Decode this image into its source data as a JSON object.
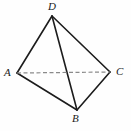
{
  "figure": {
    "kind": "tetrahedron-diagram",
    "background_color": "#fefefe",
    "stroke_color": "#1c1c1c",
    "hidden_stroke_color": "#8a8a8a",
    "solid_stroke_width": 1.6,
    "hidden_stroke_width": 1.2,
    "hidden_dash_pattern": "4,2.5",
    "vertices": [
      {
        "id": "D",
        "label": "D",
        "x": 52,
        "y": 16
      },
      {
        "id": "A",
        "label": "A",
        "x": 17,
        "y": 73
      },
      {
        "id": "C",
        "label": "C",
        "x": 110,
        "y": 72
      },
      {
        "id": "B",
        "label": "B",
        "x": 77,
        "y": 110
      }
    ],
    "edges": [
      {
        "id": "DA",
        "from": "D",
        "to": "A",
        "style": "solid",
        "x1": 52,
        "y1": 16,
        "x2": 17,
        "y2": 73
      },
      {
        "id": "DC",
        "from": "D",
        "to": "C",
        "style": "solid",
        "x1": 52,
        "y1": 16,
        "x2": 110,
        "y2": 72
      },
      {
        "id": "DB",
        "from": "D",
        "to": "B",
        "style": "solid",
        "x1": 52,
        "y1": 16,
        "x2": 77,
        "y2": 110
      },
      {
        "id": "AB",
        "from": "A",
        "to": "B",
        "style": "solid",
        "x1": 17,
        "y1": 73,
        "x2": 77,
        "y2": 110
      },
      {
        "id": "BC",
        "from": "B",
        "to": "C",
        "style": "solid",
        "x1": 77,
        "y1": 110,
        "x2": 110,
        "y2": 72
      },
      {
        "id": "AC",
        "from": "A",
        "to": "C",
        "style": "dashed",
        "x1": 17,
        "y1": 73,
        "x2": 110,
        "y2": 72
      }
    ]
  }
}
